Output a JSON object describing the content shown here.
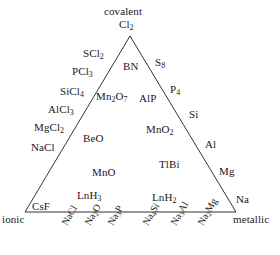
{
  "diagram": {
    "type": "van-arkel-ketelaar-triangle",
    "corners": {
      "top": "covalent",
      "bottom_left": "ionic",
      "bottom_right": "metallic"
    },
    "vertex_species": {
      "top": "Cl2",
      "bottom_left": "CsF",
      "bottom_right": "Na"
    },
    "line_color": "#333333",
    "background_color": "#ffffff",
    "text_color": "#1a1a1a"
  },
  "left_edge_labels": [
    {
      "formula": "SCl2",
      "html": "SCl<sub>2</sub>"
    },
    {
      "formula": "PCl3",
      "html": "PCl<sub>3</sub>"
    },
    {
      "formula": "SiCl4",
      "html": "SiCl<sub>4</sub>"
    },
    {
      "formula": "AlCl3",
      "html": "AlCl<sub>3</sub>"
    },
    {
      "formula": "MgCl2",
      "html": "MgCl<sub>2</sub>"
    },
    {
      "formula": "NaCl",
      "html": "NaCl"
    },
    {
      "formula": "CsF",
      "html": "CsF"
    }
  ],
  "right_edge_labels": [
    {
      "formula": "S8",
      "html": "S<sub>8</sub>"
    },
    {
      "formula": "P4",
      "html": "P<sub>4</sub>"
    },
    {
      "formula": "Si",
      "html": "Si"
    },
    {
      "formula": "Al",
      "html": "Al"
    },
    {
      "formula": "Mg",
      "html": "Mg"
    },
    {
      "formula": "Na",
      "html": "Na"
    }
  ],
  "interior_labels": [
    {
      "formula": "Cl2",
      "html": "Cl<sub>2</sub>"
    },
    {
      "formula": "BN",
      "html": "BN"
    },
    {
      "formula": "Mn2O7",
      "html": "Mn<sub>2</sub>O<sub>7</sub>"
    },
    {
      "formula": "AlP",
      "html": "AlP"
    },
    {
      "formula": "BeO",
      "html": "BeO"
    },
    {
      "formula": "MnO2",
      "html": "MnO<sub>2</sub>"
    },
    {
      "formula": "MnO",
      "html": "MnO"
    },
    {
      "formula": "TlBi",
      "html": "TlBi"
    },
    {
      "formula": "LnH3",
      "html": "LnH<sub>3</sub>"
    },
    {
      "formula": "LnH2",
      "html": "LnH<sub>2</sub>"
    }
  ],
  "bottom_axis_labels": [
    {
      "formula": "NaCl",
      "html": "NaCl"
    },
    {
      "formula": "Na2O",
      "html": "Na<sub>2</sub>O"
    },
    {
      "formula": "Na3P",
      "html": "Na<sub>3</sub>P"
    },
    {
      "formula": "Na4Si",
      "html": "Na<sub>4</sub>Si"
    },
    {
      "formula": "Na3Al",
      "html": "Na<sub>3</sub>Al"
    },
    {
      "formula": "Na2Mg",
      "html": "Na<sub>2</sub>Mg"
    }
  ],
  "text": {
    "covalent": "covalent",
    "ionic": "ionic",
    "metallic": "metallic"
  }
}
